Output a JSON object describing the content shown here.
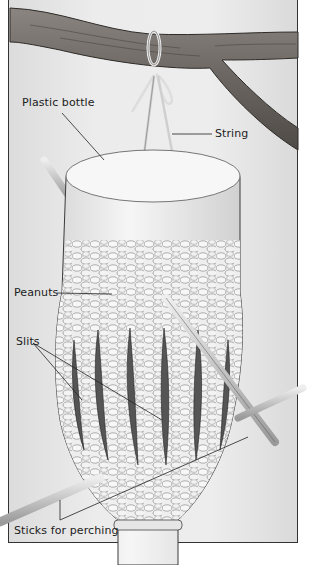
{
  "diagram": {
    "labels": {
      "plastic_bottle": "Plastic bottle",
      "string": "String",
      "peanuts": "Peanuts",
      "slits": "Slits",
      "sticks": "Sticks for perching"
    },
    "colors": {
      "background": "#e8e8e8",
      "branch": "#6f6a66",
      "bottle": "#f4f4f4",
      "outline": "#333333"
    }
  }
}
